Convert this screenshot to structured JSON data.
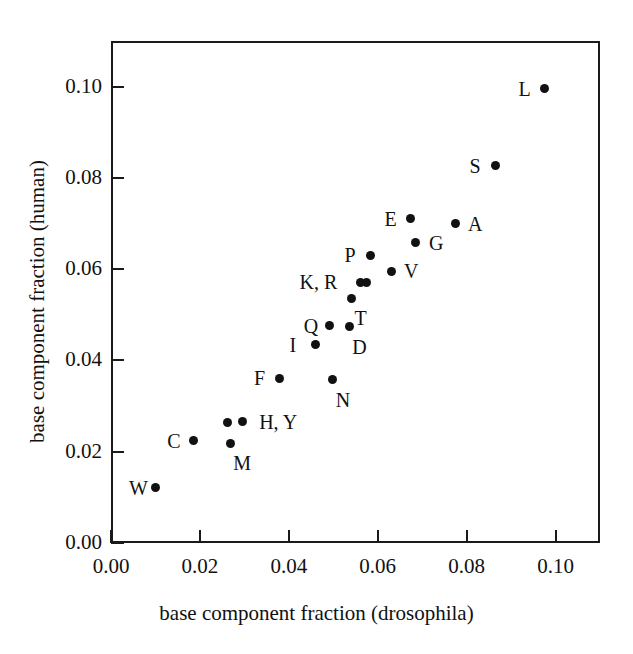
{
  "chart_data": {
    "type": "scatter",
    "title": "",
    "xlabel": "base component fraction (drosophila)",
    "ylabel": "base component fraction (human)",
    "xlim": [
      0.0,
      0.11
    ],
    "ylim": [
      0.0,
      0.11
    ],
    "xticks": [
      0.0,
      0.02,
      0.04,
      0.06,
      0.08,
      0.1
    ],
    "yticks": [
      0.0,
      0.02,
      0.04,
      0.06,
      0.08,
      0.1
    ],
    "xticklabels": [
      "0.00",
      "0.02",
      "0.04",
      "0.06",
      "0.08",
      "0.10"
    ],
    "yticklabels": [
      "0.00",
      "0.02",
      "0.04",
      "0.06",
      "0.08",
      "0.10"
    ],
    "grid": false,
    "legend": false,
    "marker_color": "#111111",
    "marker_shape": "circle",
    "points": [
      {
        "label": "W",
        "label_text": "W",
        "x": 0.0099,
        "y": 0.0121,
        "label_pos": "left"
      },
      {
        "label": "C",
        "label_text": "C",
        "x": 0.0185,
        "y": 0.0224,
        "label_pos": "left"
      },
      {
        "label": "M",
        "label_text": "M",
        "x": 0.0268,
        "y": 0.0219,
        "label_pos": "below-right"
      },
      {
        "label": "H",
        "label_text": "H, Y",
        "x": 0.0261,
        "y": 0.0264,
        "label_pos": "none"
      },
      {
        "label": "Y",
        "label_text": "H, Y",
        "x": 0.0295,
        "y": 0.0266,
        "label_pos": "right-pair"
      },
      {
        "label": "F",
        "label_text": "F",
        "x": 0.038,
        "y": 0.0361,
        "label_pos": "left"
      },
      {
        "label": "N",
        "label_text": "N",
        "x": 0.0499,
        "y": 0.0358,
        "label_pos": "below-right"
      },
      {
        "label": "I",
        "label_text": "I",
        "x": 0.046,
        "y": 0.0434,
        "label_pos": "left"
      },
      {
        "label": "Q",
        "label_text": "Q",
        "x": 0.0492,
        "y": 0.0476,
        "label_pos": "left"
      },
      {
        "label": "D",
        "label_text": "D",
        "x": 0.0536,
        "y": 0.0474,
        "label_pos": "below-right"
      },
      {
        "label": "T",
        "label_text": "T",
        "x": 0.0541,
        "y": 0.0536,
        "label_pos": "below-right"
      },
      {
        "label": "K",
        "label_text": "K, R",
        "x": 0.0562,
        "y": 0.0571,
        "label_pos": "none"
      },
      {
        "label": "R",
        "label_text": "K, R",
        "x": 0.0575,
        "y": 0.0571,
        "label_pos": "left-pair"
      },
      {
        "label": "P",
        "label_text": "P",
        "x": 0.0584,
        "y": 0.0631,
        "label_pos": "left"
      },
      {
        "label": "V",
        "label_text": "V",
        "x": 0.063,
        "y": 0.0595,
        "label_pos": "right"
      },
      {
        "label": "E",
        "label_text": "E",
        "x": 0.0674,
        "y": 0.0711,
        "label_pos": "left"
      },
      {
        "label": "G",
        "label_text": "G",
        "x": 0.0686,
        "y": 0.0658,
        "label_pos": "right"
      },
      {
        "label": "A",
        "label_text": "A",
        "x": 0.0774,
        "y": 0.07,
        "label_pos": "right"
      },
      {
        "label": "S",
        "label_text": "S",
        "x": 0.0865,
        "y": 0.0827,
        "label_pos": "left"
      },
      {
        "label": "L",
        "label_text": "L",
        "x": 0.0975,
        "y": 0.0995,
        "label_pos": "left"
      }
    ]
  },
  "axes": {
    "x_title": "base component fraction (drosophila)",
    "y_title": "base component fraction (human)"
  }
}
